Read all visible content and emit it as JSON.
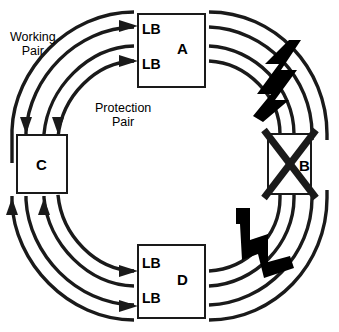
{
  "diagram": {
    "background_color": "#ffffff",
    "line_color": "#1a1a1a",
    "fiber_break_color": "#000000"
  },
  "labels": {
    "working_pair_line1": "Working",
    "working_pair_line2": "Pair",
    "protection_pair_line1": "Protection",
    "protection_pair_line2": "Pair"
  },
  "nodes": [
    {
      "id": "A",
      "letter": "A",
      "position": "top",
      "loopbacks": [
        "LB",
        "LB"
      ],
      "failed": false
    },
    {
      "id": "B",
      "letter": "B",
      "position": "right",
      "loopbacks": [],
      "failed": true
    },
    {
      "id": "C",
      "letter": "C",
      "position": "left",
      "loopbacks": [],
      "failed": false
    },
    {
      "id": "D",
      "letter": "D",
      "position": "bottom",
      "loopbacks": [
        "LB",
        "LB"
      ],
      "failed": false
    }
  ],
  "fiber_breaks": [
    {
      "id": "break-upper-right",
      "between": "A-B"
    },
    {
      "id": "break-lower-right",
      "between": "B-D"
    }
  ],
  "ring_counts": {
    "concentric_paths": 4,
    "arrowheads_into_a": 2,
    "arrowheads_into_c_top": 2,
    "arrowheads_into_c_bottom": 2,
    "arrowheads_into_d": 2
  }
}
